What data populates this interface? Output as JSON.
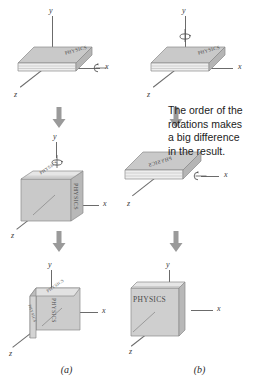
{
  "figure": {
    "background_color": "#ffffff",
    "axis_color": "#6b6b6b",
    "arrow_color": "#9a9a9a",
    "book_cover_color": "#c9c9c9",
    "book_page_color": "#efefef",
    "text_color": "#1c1c1c"
  },
  "callout": {
    "line1": "The order of the",
    "line2": "rotations makes",
    "line3": "a big difference",
    "line4": "in the result."
  },
  "axes": {
    "y": "y",
    "x": "x",
    "z": "z"
  },
  "book": {
    "title": "PHYSICS"
  },
  "captions": {
    "left": "(a)",
    "right": "(b)"
  },
  "panels": [
    {
      "id": "a",
      "caption": "(a)",
      "steps": [
        {
          "step": 1,
          "book_state": "flat-horizontal-cover-up",
          "rotation_axis": "x",
          "rotation_glyph": "circular-arrow-about-x",
          "axis_labels": {
            "y": "y",
            "x": "x",
            "z": "z"
          }
        },
        {
          "step": 2,
          "book_state": "upright-cover-facing-viewer-rotated",
          "rotation_axis": "y",
          "rotation_glyph": "circular-arrow-about-y",
          "title_orientation": "vertical",
          "axis_labels": {
            "y": "y",
            "x": "x",
            "z": "z"
          }
        },
        {
          "step": 3,
          "book_state": "edge-on-spine-toward-viewer",
          "rotation_axis": null,
          "rotation_glyph": null,
          "axis_labels": {
            "y": "y",
            "x": "x",
            "z": "z"
          }
        }
      ]
    },
    {
      "id": "b",
      "caption": "(b)",
      "steps": [
        {
          "step": 1,
          "book_state": "flat-horizontal-cover-up",
          "rotation_axis": "y",
          "rotation_glyph": "circular-arrow-about-y",
          "axis_labels": {
            "y": "y",
            "x": "x",
            "z": "z"
          }
        },
        {
          "step": 2,
          "book_state": "flat-horizontal-title-reversed",
          "rotation_axis": "x",
          "rotation_glyph": "circular-arrow-about-x",
          "title_orientation": "mirrored",
          "axis_labels": {
            "x": "x",
            "z": "z"
          }
        },
        {
          "step": 3,
          "book_state": "upright-cover-facing-viewer",
          "rotation_axis": null,
          "rotation_glyph": null,
          "title_orientation": "horizontal-readable",
          "axis_labels": {
            "y": "y",
            "x": "x",
            "z": "z"
          }
        }
      ]
    }
  ]
}
